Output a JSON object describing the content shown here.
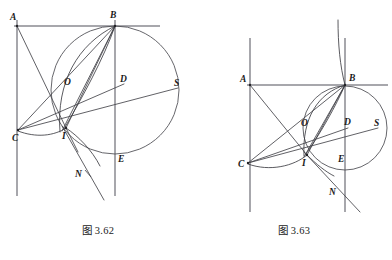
{
  "page": {
    "background_color": "#ffffff",
    "line_color": "#44444a",
    "axis_color": "#8a8a90",
    "label_color": "#1a1a1a"
  },
  "figures": [
    {
      "id": "figure-left",
      "caption": "图 3.62",
      "points": [
        {
          "key": "A",
          "label": "A",
          "x": 17,
          "y": 26,
          "label_x": 10,
          "label_y": 20
        },
        {
          "key": "B",
          "label": "B",
          "x": 115,
          "y": 26,
          "label_x": 110,
          "label_y": 18
        },
        {
          "key": "C",
          "label": "C",
          "x": 18,
          "y": 130,
          "label_x": 12,
          "label_y": 141
        },
        {
          "key": "O",
          "label": "O",
          "x": 70,
          "y": 88,
          "label_x": 64,
          "label_y": 85
        },
        {
          "key": "D",
          "label": "D",
          "x": 124,
          "y": 84,
          "label_x": 120,
          "label_y": 82
        },
        {
          "key": "S",
          "label": "S",
          "x": 178,
          "y": 88,
          "label_x": 174,
          "label_y": 86
        },
        {
          "key": "I",
          "label": "I",
          "x": 66,
          "y": 128,
          "label_x": 62,
          "label_y": 139
        },
        {
          "key": "E",
          "label": "E",
          "x": 122,
          "y": 155,
          "label_x": 118,
          "label_y": 162
        },
        {
          "key": "N",
          "label": "N",
          "x": 84,
          "y": 174,
          "label_x": 77,
          "label_y": 177
        }
      ],
      "circle": {
        "cx": 115,
        "cy": 90,
        "r": 64
      }
    },
    {
      "id": "figure-right",
      "caption": "图 3.63",
      "points": [
        {
          "key": "A",
          "label": "A",
          "x": 250,
          "y": 85,
          "label_x": 242,
          "label_y": 82
        },
        {
          "key": "B",
          "label": "B",
          "x": 345,
          "y": 85,
          "label_x": 349,
          "label_y": 81
        },
        {
          "key": "C",
          "label": "C",
          "x": 248,
          "y": 163,
          "label_x": 240,
          "label_y": 166
        },
        {
          "key": "O",
          "label": "O",
          "x": 308,
          "y": 128,
          "label_x": 303,
          "label_y": 126
        },
        {
          "key": "D",
          "label": "D",
          "x": 348,
          "y": 128,
          "label_x": 344,
          "label_y": 125
        },
        {
          "key": "S",
          "label": "S",
          "x": 378,
          "y": 128,
          "label_x": 374,
          "label_y": 126
        },
        {
          "key": "I",
          "label": "I",
          "x": 307,
          "y": 155,
          "label_x": 303,
          "label_y": 165
        },
        {
          "key": "E",
          "label": "E",
          "x": 336,
          "y": 163,
          "label_x": 338,
          "label_y": 162
        },
        {
          "key": "N",
          "label": "N",
          "x": 338,
          "y": 192,
          "label_x": 331,
          "label_y": 194
        }
      ],
      "circle": {
        "cx": 345,
        "cy": 128,
        "r": 42
      }
    }
  ],
  "captions": {
    "left": "图 3.62",
    "right": "图 3.63"
  }
}
